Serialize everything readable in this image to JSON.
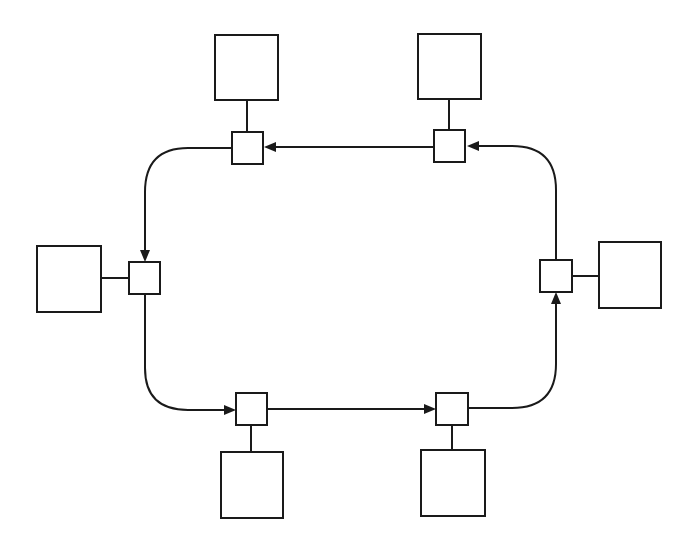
{
  "diagram": {
    "type": "ring-network",
    "flow_direction": "counter-clockwise",
    "colors": {
      "stroke": "#1a1a1a",
      "background": "#ffffff"
    },
    "stations": [
      {
        "id": "station-top-left",
        "label": ""
      },
      {
        "id": "station-top-right",
        "label": ""
      },
      {
        "id": "station-right",
        "label": ""
      },
      {
        "id": "station-bottom-right",
        "label": ""
      },
      {
        "id": "station-bottom-left",
        "label": ""
      },
      {
        "id": "station-left",
        "label": ""
      }
    ],
    "ring_nodes": [
      {
        "id": "node-top-left",
        "attached_to": "station-top-left"
      },
      {
        "id": "node-top-right",
        "attached_to": "station-top-right"
      },
      {
        "id": "node-right",
        "attached_to": "station-right"
      },
      {
        "id": "node-bottom-right",
        "attached_to": "station-bottom-right"
      },
      {
        "id": "node-bottom-left",
        "attached_to": "station-bottom-left"
      },
      {
        "id": "node-left",
        "attached_to": "station-left"
      }
    ],
    "edges": [
      {
        "from": "node-top-right",
        "to": "node-top-left"
      },
      {
        "from": "node-top-left",
        "to": "node-left"
      },
      {
        "from": "node-left",
        "to": "node-bottom-left"
      },
      {
        "from": "node-bottom-left",
        "to": "node-bottom-right"
      },
      {
        "from": "node-bottom-right",
        "to": "node-right"
      },
      {
        "from": "node-right",
        "to": "node-top-right"
      }
    ]
  }
}
